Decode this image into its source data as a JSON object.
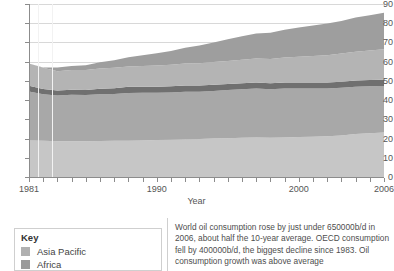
{
  "chart_data": {
    "type": "area",
    "stacked": true,
    "title": "",
    "xlabel": "Year",
    "ylabel": "",
    "xlim": [
      1981,
      2006
    ],
    "ylim": [
      0,
      90
    ],
    "grid": true,
    "y_ticks": [
      0,
      10,
      20,
      30,
      40,
      50,
      60,
      70,
      80,
      90
    ],
    "x_ticks": [
      1981,
      1982,
      1983,
      1984,
      1985,
      1986,
      1987,
      1988,
      1989,
      1990,
      1991,
      1992,
      1993,
      1994,
      1995,
      1996,
      1997,
      1998,
      1999,
      2000,
      2001,
      2002,
      2003,
      2004,
      2005,
      2006
    ],
    "x_tick_labels": [
      "1981",
      "1990",
      "2000",
      "2006"
    ],
    "x_tick_label_years": [
      1981,
      1990,
      2000,
      2006
    ],
    "legend_position": "bottom-left",
    "x": [
      1981,
      1982,
      1983,
      1984,
      1985,
      1986,
      1987,
      1988,
      1989,
      1990,
      1991,
      1992,
      1993,
      1994,
      1995,
      1996,
      1997,
      1998,
      1999,
      2000,
      2001,
      2002,
      2003,
      2004,
      2005,
      2006
    ],
    "series": [
      {
        "name": "Asia Pacific",
        "color": "#c6c6c6",
        "values": [
          19.0,
          18.8,
          18.6,
          18.6,
          18.6,
          18.7,
          18.8,
          18.9,
          19.0,
          19.2,
          19.4,
          19.6,
          19.8,
          20.0,
          20.2,
          20.4,
          20.6,
          20.4,
          20.6,
          20.8,
          21.0,
          21.2,
          21.6,
          22.4,
          22.8,
          23.2
        ]
      },
      {
        "name": "Africa",
        "color": "#a8a8a8",
        "values": [
          25.5,
          24.2,
          23.8,
          24.2,
          24.0,
          24.4,
          24.4,
          24.8,
          24.8,
          24.6,
          24.6,
          24.8,
          24.6,
          24.8,
          25.0,
          25.2,
          25.4,
          25.2,
          25.4,
          25.2,
          25.0,
          24.8,
          24.8,
          24.6,
          24.4,
          24.2
        ]
      },
      {
        "name": "",
        "color": "#707070",
        "values": [
          3.0,
          2.8,
          2.6,
          2.6,
          2.6,
          2.8,
          3.0,
          3.2,
          3.2,
          3.2,
          3.2,
          3.2,
          3.2,
          3.2,
          3.2,
          3.2,
          3.2,
          3.2,
          3.2,
          3.2,
          3.2,
          3.2,
          3.2,
          3.2,
          3.2,
          3.2
        ]
      },
      {
        "name": "",
        "color": "#b4b4b4",
        "values": [
          11.5,
          11.0,
          10.0,
          10.2,
          10.4,
          10.6,
          10.6,
          10.6,
          10.8,
          11.0,
          11.2,
          11.4,
          11.6,
          11.8,
          12.0,
          12.2,
          12.4,
          12.6,
          13.0,
          13.4,
          13.8,
          14.2,
          14.6,
          15.0,
          15.4,
          15.8
        ]
      },
      {
        "name": "",
        "color": "#9e9e9e",
        "values": [
          0.0,
          0.2,
          2.0,
          2.2,
          2.6,
          3.2,
          4.0,
          4.8,
          5.6,
          6.4,
          7.2,
          8.2,
          9.2,
          10.2,
          11.2,
          12.2,
          13.0,
          13.6,
          14.4,
          15.2,
          15.8,
          16.4,
          17.0,
          17.8,
          18.4,
          19.0
        ]
      }
    ]
  },
  "axis": {
    "x_title": "Year"
  },
  "legend": {
    "title": "Key",
    "items": [
      {
        "label": "Asia Pacific",
        "color": "#b0b0b0"
      },
      {
        "label": "Africa",
        "color": "#9a9a9a"
      }
    ]
  },
  "caption": {
    "text": "World oil consumption rose by just under 650000b/d in 2006, about half the 10-year average. OECD consumption fell by 400000b/d, the biggest decline since 1983. Oil consumption growth was above average"
  }
}
